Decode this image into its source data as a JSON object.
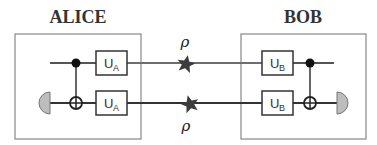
{
  "parties": {
    "alice": {
      "title": "ALICE",
      "gates": [
        {
          "label": "U",
          "subscript": "A"
        },
        {
          "label": "U",
          "subscript": "A"
        }
      ]
    },
    "bob": {
      "title": "BOB",
      "gates": [
        {
          "label": "U",
          "subscript": "B"
        },
        {
          "label": "U",
          "subscript": "B"
        }
      ]
    }
  },
  "channel": {
    "states": [
      {
        "label": "ρ",
        "position": "above-top-wire"
      },
      {
        "label": "ρ",
        "position": "below-bottom-wire"
      }
    ]
  },
  "colors": {
    "box_border": "#888888",
    "wire": "#3a3a3a",
    "channel_wire_top": "#6e6e6e",
    "star": "#3c3c3c",
    "detector_fill": "#bdbdbd",
    "text": "#333333"
  },
  "icons": {
    "control": "filled-dot",
    "target": "circle-plus",
    "detector": "half-disc",
    "source": "star"
  }
}
